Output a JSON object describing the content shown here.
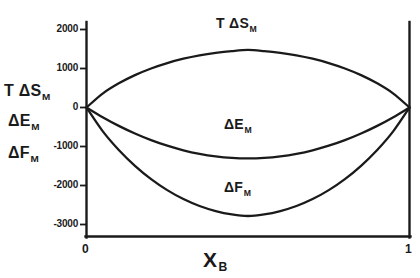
{
  "chart_data": {
    "type": "line",
    "title": "",
    "subtitle": "",
    "xlabel": "X_B",
    "xlabel_base": "X",
    "xlabel_sub": "B",
    "ylabel": "",
    "xlim": [
      0,
      1
    ],
    "ylim": [
      -3400,
      2200
    ],
    "grid": false,
    "legend_position": "inline-annotations",
    "x_ticks": [
      0,
      1
    ],
    "x_tick_labels": [
      "0",
      "1"
    ],
    "y_ticks": [
      2000,
      1000,
      0,
      -1000,
      -2000,
      -3000
    ],
    "y_tick_labels": [
      "2000",
      "1000",
      "0",
      "-1000",
      "-2000",
      "-3000"
    ],
    "axis_color": "#1a1a1a",
    "curve_color": "#1a1a1a",
    "x": [
      0,
      0.05,
      0.1,
      0.15,
      0.2,
      0.25,
      0.3,
      0.35,
      0.4,
      0.45,
      0.5,
      0.55,
      0.6,
      0.65,
      0.7,
      0.75,
      0.8,
      0.85,
      0.9,
      0.95,
      1
    ],
    "series": [
      {
        "name": "T ΔS_M",
        "label_base": "T ΔS",
        "label_sub": "M",
        "color": "#1a1a1a",
        "peak_value": 1480,
        "peak_x": 0.5,
        "values": [
          0,
          355,
          616,
          825,
          995,
          1133,
          1244,
          1330,
          1394,
          1440,
          1468,
          1440,
          1394,
          1330,
          1244,
          1133,
          995,
          825,
          616,
          355,
          0
        ]
      },
      {
        "name": "ΔE_M",
        "label_base": "ΔE",
        "label_sub": "M",
        "color": "#1a1a1a",
        "min_value": -1300,
        "min_x": 0.5,
        "values": [
          0,
          -247,
          -468,
          -663,
          -832,
          -975,
          -1092,
          -1183,
          -1248,
          -1287,
          -1300,
          -1287,
          -1248,
          -1183,
          -1092,
          -975,
          -832,
          -663,
          -468,
          -247,
          0
        ]
      },
      {
        "name": "ΔF_M",
        "label_base": "ΔF",
        "label_sub": "M",
        "color": "#1a1a1a",
        "min_value": -2750,
        "min_x": 0.5,
        "values": [
          0,
          -602,
          -1084,
          -1488,
          -1827,
          -2108,
          -2336,
          -2513,
          -2642,
          -2727,
          -2768,
          -2727,
          -2642,
          -2513,
          -2336,
          -2108,
          -1827,
          -1488,
          -1084,
          -602,
          0
        ]
      }
    ],
    "annotations": [
      {
        "text": "T ΔS_M",
        "base": "T ΔS",
        "sub": "M",
        "x": 0.5,
        "y": 1900
      },
      {
        "text": "ΔE_M",
        "base": "ΔE",
        "sub": "M",
        "x": 0.5,
        "y": -800
      },
      {
        "text": "ΔF_M",
        "base": "ΔF",
        "sub": "M",
        "x": 0.5,
        "y": -2250
      }
    ]
  },
  "axis": {
    "y_tick_labels": {
      "t0": "2000",
      "t1": "1000",
      "t2": "0",
      "t3": "-1000",
      "t4": "-2000",
      "t5": "-3000"
    },
    "x_tick_labels": {
      "left": "0",
      "right": "1"
    },
    "x_title_base": "X",
    "x_title_sub": "B"
  },
  "side_labels": [
    {
      "base": "T ΔS",
      "sub": "M"
    },
    {
      "base": "ΔE",
      "sub": "M"
    },
    {
      "base": "ΔF",
      "sub": "M"
    }
  ],
  "side_label_entries": {
    "entropy_base": "T ΔS",
    "entropy_sub": "M",
    "energy_base": "ΔE",
    "energy_sub": "M",
    "free_energy_base": "ΔF",
    "free_energy_sub": "M"
  },
  "curve_annotations": {
    "entropy_base": "T ΔS",
    "entropy_sub": "M",
    "energy_base": "ΔE",
    "energy_sub": "M",
    "free_energy_base": "ΔF",
    "free_energy_sub": "M"
  }
}
